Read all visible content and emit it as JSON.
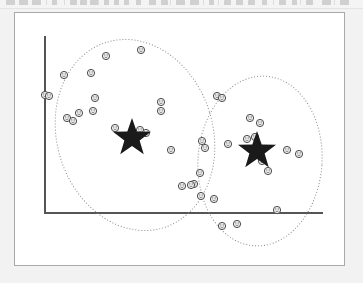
{
  "toolbar": {
    "description": "cropped application toolbar row, icons illegible",
    "icon_slots": [
      {
        "name": "toolbar-icon-1",
        "x": 6,
        "w": 9
      },
      {
        "name": "toolbar-icon-2",
        "x": 19,
        "w": 9
      },
      {
        "name": "toolbar-icon-3",
        "x": 32,
        "w": 9
      },
      {
        "name": "toolbar-icon-4",
        "x": 52,
        "w": 5
      },
      {
        "name": "toolbar-icon-5",
        "x": 70,
        "w": 7
      },
      {
        "name": "toolbar-icon-6",
        "x": 80,
        "w": 7
      },
      {
        "name": "toolbar-icon-7",
        "x": 90,
        "w": 9
      },
      {
        "name": "toolbar-icon-8",
        "x": 104,
        "w": 5
      },
      {
        "name": "toolbar-icon-9",
        "x": 114,
        "w": 5
      },
      {
        "name": "toolbar-icon-10",
        "x": 124,
        "w": 5
      },
      {
        "name": "toolbar-icon-11",
        "x": 136,
        "w": 5
      },
      {
        "name": "toolbar-icon-12",
        "x": 149,
        "w": 7
      },
      {
        "name": "toolbar-icon-13",
        "x": 161,
        "w": 7
      },
      {
        "name": "toolbar-icon-14",
        "x": 176,
        "w": 9
      },
      {
        "name": "toolbar-icon-15",
        "x": 190,
        "w": 9
      },
      {
        "name": "toolbar-icon-16",
        "x": 209,
        "w": 5
      },
      {
        "name": "toolbar-icon-17",
        "x": 224,
        "w": 7
      },
      {
        "name": "toolbar-icon-18",
        "x": 236,
        "w": 7
      },
      {
        "name": "toolbar-icon-19",
        "x": 248,
        "w": 7
      },
      {
        "name": "toolbar-icon-20",
        "x": 262,
        "w": 5
      },
      {
        "name": "toolbar-icon-21",
        "x": 279,
        "w": 7
      },
      {
        "name": "toolbar-icon-22",
        "x": 292,
        "w": 5
      },
      {
        "name": "toolbar-icon-23",
        "x": 306,
        "w": 7
      },
      {
        "name": "toolbar-icon-24",
        "x": 322,
        "w": 9
      },
      {
        "name": "toolbar-icon-25",
        "x": 340,
        "w": 9
      }
    ],
    "separators": [
      46,
      64,
      98,
      170,
      203,
      218,
      273,
      300,
      334
    ]
  },
  "figure": {
    "title": "",
    "background": "#ffffff",
    "page_border_color": "#a9a9a9",
    "axis_color": "#555555",
    "axis_width": 2,
    "ellipse_color": "#8a8a8a",
    "star_color": "#1a1a1a",
    "marker_stroke": "#4a4a4a",
    "marker_fill": "#f0f0f0"
  },
  "chart_data": {
    "type": "scatter",
    "title": "",
    "subtitle": "",
    "xlabel": "",
    "ylabel": "",
    "grid": false,
    "legend": "none",
    "xlim": [
      0,
      331
    ],
    "ylim": [
      0,
      254
    ],
    "axes": {
      "y_axis": {
        "x": 30,
        "y_top": 24,
        "y_bottom": 200
      },
      "x_axis": {
        "y": 200,
        "x_left": 30,
        "x_right": 307
      }
    },
    "annotations": [
      {
        "name": "cluster-1-ellipse",
        "shape": "ellipse",
        "cx": 120,
        "cy": 122,
        "rx": 78,
        "ry": 97,
        "rotation": -17,
        "style": "dotted"
      },
      {
        "name": "cluster-2-ellipse",
        "shape": "ellipse",
        "cx": 245,
        "cy": 148,
        "rx": 62,
        "ry": 85,
        "rotation": 4,
        "style": "dotted"
      }
    ],
    "series": [
      {
        "name": "cluster-1-centroid",
        "marker": "star",
        "label": "Centroid 1",
        "points": [
          {
            "x": 117,
            "y": 125
          }
        ]
      },
      {
        "name": "cluster-2-centroid",
        "marker": "star",
        "label": "Centroid 2",
        "points": [
          {
            "x": 242,
            "y": 138
          }
        ]
      },
      {
        "name": "cluster-1-points",
        "marker": "circle",
        "label": "Cluster 1 data points",
        "count": 19,
        "points": [
          {
            "x": 30,
            "y": 82
          },
          {
            "x": 34,
            "y": 83
          },
          {
            "x": 49,
            "y": 62
          },
          {
            "x": 76,
            "y": 60
          },
          {
            "x": 91,
            "y": 43
          },
          {
            "x": 52,
            "y": 105
          },
          {
            "x": 58,
            "y": 108
          },
          {
            "x": 64,
            "y": 100
          },
          {
            "x": 80,
            "y": 85
          },
          {
            "x": 78,
            "y": 98
          },
          {
            "x": 126,
            "y": 37
          },
          {
            "x": 146,
            "y": 89
          },
          {
            "x": 146,
            "y": 98
          },
          {
            "x": 100,
            "y": 115
          },
          {
            "x": 125,
            "y": 117
          },
          {
            "x": 131,
            "y": 120
          },
          {
            "x": 156,
            "y": 137
          },
          {
            "x": 167,
            "y": 173
          },
          {
            "x": 179,
            "y": 171
          }
        ]
      },
      {
        "name": "cluster-2-points",
        "marker": "circle",
        "label": "Cluster 2 data points",
        "count": 20,
        "points": [
          {
            "x": 187,
            "y": 128
          },
          {
            "x": 190,
            "y": 135
          },
          {
            "x": 185,
            "y": 160
          },
          {
            "x": 186,
            "y": 183
          },
          {
            "x": 199,
            "y": 186
          },
          {
            "x": 202,
            "y": 83
          },
          {
            "x": 207,
            "y": 85
          },
          {
            "x": 213,
            "y": 131
          },
          {
            "x": 235,
            "y": 105
          },
          {
            "x": 245,
            "y": 110
          },
          {
            "x": 232,
            "y": 126
          },
          {
            "x": 240,
            "y": 124
          },
          {
            "x": 247,
            "y": 148
          },
          {
            "x": 253,
            "y": 158
          },
          {
            "x": 272,
            "y": 137
          },
          {
            "x": 284,
            "y": 141
          },
          {
            "x": 262,
            "y": 197
          },
          {
            "x": 207,
            "y": 213
          },
          {
            "x": 222,
            "y": 211
          },
          {
            "x": 176,
            "y": 172
          }
        ]
      }
    ]
  }
}
